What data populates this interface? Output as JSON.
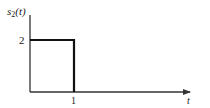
{
  "diagram": {
    "title_label": "s",
    "title_sub": "2",
    "title_arg": "(t)",
    "y_tick_label": "2",
    "x_tick_label": "1",
    "x_axis_label": "t",
    "signal": {
      "type": "rectangular pulse",
      "amplitude": 2,
      "start": 0,
      "end": 1
    },
    "colors": {
      "axis": "#333333",
      "signal": "#111111"
    }
  }
}
